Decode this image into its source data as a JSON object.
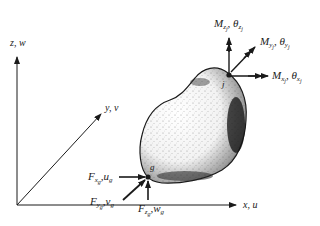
{
  "figure": {
    "axes": {
      "x_label": "x, u",
      "y_label": "y, v",
      "z_label": "z, w"
    },
    "points": {
      "g": {
        "name": "g"
      },
      "j": {
        "name": "j"
      }
    },
    "forces_at_g": {
      "fx": {
        "main": "F",
        "sub": "x",
        "subsub": "g",
        "sep": ",",
        "disp": "u",
        "disp_sub": "g"
      },
      "fy": {
        "main": "F",
        "sub": "y",
        "subsub": "g",
        "sep": ",",
        "disp": "v",
        "disp_sub": "g"
      },
      "fz": {
        "main": "F",
        "sub": "z",
        "subsub": "g",
        "sep": ",",
        "disp": "w",
        "disp_sub": "g"
      }
    },
    "moments_at_j": {
      "mx": {
        "main": "M",
        "sub": "x",
        "subsub": "j",
        "sep": ", ",
        "rot": "θ",
        "rot_sub": "x",
        "rot_subsub": "j"
      },
      "my": {
        "main": "M",
        "sub": "y",
        "subsub": "j",
        "sep": ", ",
        "rot": "θ",
        "rot_sub": "y",
        "rot_subsub": "j"
      },
      "mz": {
        "main": "M",
        "sub": "z",
        "subsub": "j",
        "sep": ", ",
        "rot": "θ",
        "rot_sub": "z",
        "rot_subsub": "j"
      }
    },
    "colors": {
      "ink": "#1a1a1a",
      "background": "#ffffff"
    }
  }
}
